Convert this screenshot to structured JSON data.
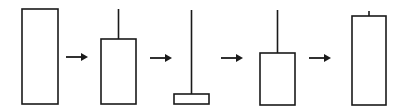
{
  "diagram": {
    "stroke_color": "#1a1a1a",
    "background": "#ffffff",
    "candles": [
      {
        "name": "tall-body-candle",
        "x": 22,
        "width": 36,
        "body_top": 9,
        "body_bottom": 104,
        "wick_top": null
      },
      {
        "name": "upper-shadow-candle",
        "x": 101,
        "width": 35,
        "body_top": 39,
        "body_bottom": 104,
        "wick_top": 9
      },
      {
        "name": "inverted-hammer-candle",
        "x": 174,
        "width": 35,
        "body_top": 94,
        "body_bottom": 104,
        "wick_top": 10
      },
      {
        "name": "upper-shadow-candle-2",
        "x": 260,
        "width": 35,
        "body_top": 53,
        "body_bottom": 105,
        "wick_top": 10
      },
      {
        "name": "tall-body-short-wick-candle",
        "x": 352,
        "width": 34,
        "body_top": 16,
        "body_bottom": 105,
        "wick_top": 11
      }
    ],
    "arrows": [
      {
        "name": "arrow-1",
        "x1": 66,
        "x2": 88,
        "y": 57
      },
      {
        "name": "arrow-2",
        "x1": 150,
        "x2": 172,
        "y": 58
      },
      {
        "name": "arrow-3",
        "x1": 221,
        "x2": 243,
        "y": 58
      },
      {
        "name": "arrow-4",
        "x1": 309,
        "x2": 331,
        "y": 58
      }
    ]
  }
}
